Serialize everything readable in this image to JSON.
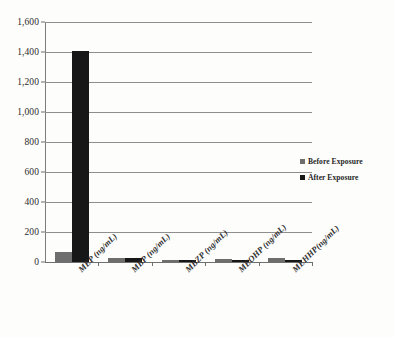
{
  "chart_data": {
    "type": "bar",
    "title": "",
    "subtitle": "",
    "xlabel": "",
    "ylabel": "",
    "ylim": [
      0,
      1600
    ],
    "ytick_step": 200,
    "yticks": [
      "0",
      "200",
      "400",
      "600",
      "800",
      "1,000",
      "1,200",
      "1,400",
      "1,600"
    ],
    "grid": "horizontal",
    "legend_position": "right",
    "categories": [
      "MEP (ng/mL)",
      "MBP (ng/mL)",
      "MBZP (ng/mL)",
      "MEOHP (ng/mL)",
      "MEHHP(ng/mL)"
    ],
    "series": [
      {
        "name": "Before Exposure",
        "color": "#6e6e6e",
        "values": [
          65,
          27,
          12,
          18,
          24
        ]
      },
      {
        "name": "After Exposure",
        "color": "#171717",
        "values": [
          1410,
          25,
          11,
          14,
          13
        ]
      }
    ]
  },
  "legend": {
    "items": [
      {
        "label": "Before Exposure",
        "color": "#6e6e6e"
      },
      {
        "label": "After Exposure",
        "color": "#171717"
      }
    ]
  },
  "colors": {
    "before_exposure": "#6e6e6e",
    "after_exposure": "#171717",
    "gridline": "#8e8e8e",
    "axis": "#6f6f6f",
    "background": "#fdfdfc",
    "text": "#2b2b2b"
  }
}
